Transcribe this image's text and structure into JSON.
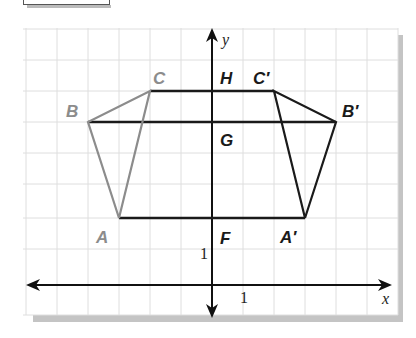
{
  "figure": {
    "axes": {
      "x_label": "x",
      "y_label": "y",
      "x_unit_label": "1",
      "y_unit_label": "1"
    },
    "points": {
      "A": {
        "label": "A",
        "coord": [
          -3,
          2
        ]
      },
      "B": {
        "label": "B",
        "coord": [
          -4,
          5
        ]
      },
      "C": {
        "label": "C",
        "coord": [
          -2,
          6
        ]
      },
      "A_prime": {
        "label": "A′",
        "coord": [
          3,
          2
        ]
      },
      "B_prime": {
        "label": "B′",
        "coord": [
          4,
          5
        ]
      },
      "C_prime": {
        "label": "C′",
        "coord": [
          2,
          6
        ]
      },
      "H": {
        "label": "H",
        "coord": [
          0,
          6
        ]
      },
      "G": {
        "label": "G",
        "coord": [
          0,
          5
        ]
      },
      "F": {
        "label": "F",
        "coord": [
          0,
          2
        ]
      }
    },
    "segments": [
      {
        "from": "C",
        "to": "C_prime",
        "label": "CC′"
      },
      {
        "from": "B",
        "to": "B_prime",
        "label": "BB′"
      },
      {
        "from": "A",
        "to": "A_prime",
        "label": "AA′"
      }
    ],
    "triangles": [
      {
        "name": "ABC",
        "vertices": [
          "A",
          "B",
          "C"
        ],
        "color": "#8c8c8c"
      },
      {
        "name": "A′B′C′",
        "vertices": [
          "A_prime",
          "B_prime",
          "C_prime"
        ],
        "color": "#1a1a1a"
      }
    ],
    "colors": {
      "grid": "#dcdcdc",
      "axis": "#111111",
      "original": "#8c8c8c",
      "image": "#1a1a1a",
      "shadow": "#bdbdbd"
    }
  }
}
